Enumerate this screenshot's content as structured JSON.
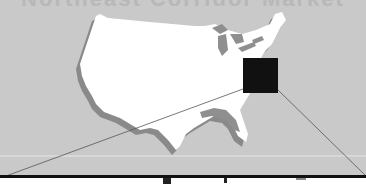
{
  "title_fragment": "Northeast Corridor Market",
  "map": {
    "region": "Contiguous United States",
    "land_color": "#ffffff",
    "shadow_color": "#8a8a8a",
    "lake_color": "#8f8f8f",
    "background_color": "#c9c9c9",
    "highlight_marker": {
      "label": "Mid-Atlantic highlight",
      "color": "#111111",
      "x": 243,
      "y": 58,
      "width": 35,
      "height": 35
    }
  },
  "callout": {
    "line_color": "#555555",
    "box_border_color": "#111111"
  }
}
